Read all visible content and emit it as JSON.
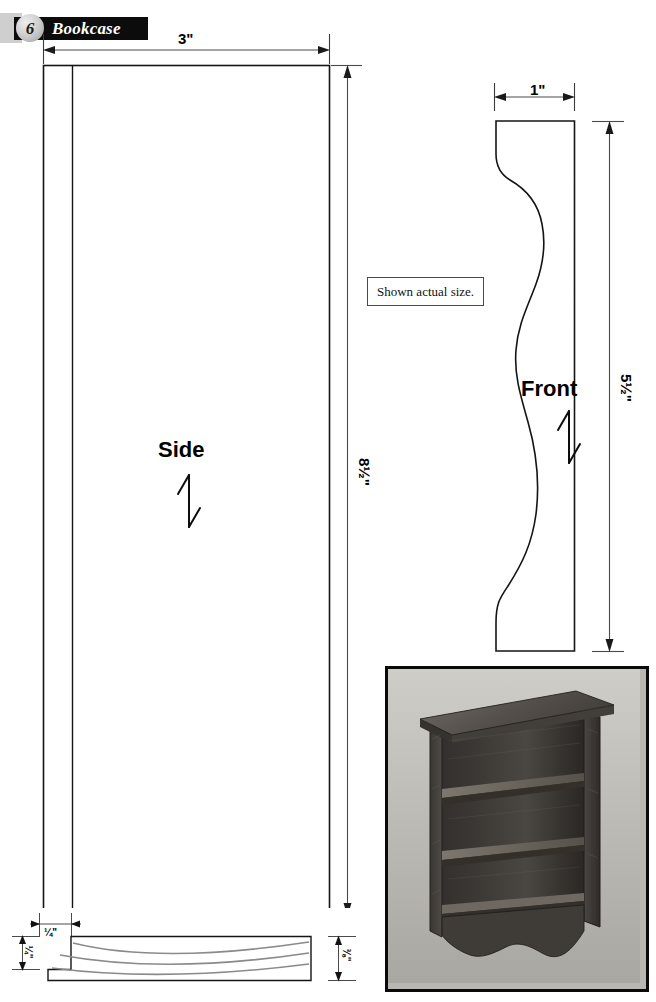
{
  "page": {
    "width": 656,
    "height": 1002,
    "background": "#ffffff",
    "ink": "#000000"
  },
  "header": {
    "number": "6",
    "title": "Bookcase",
    "bar_color": "#0c0c0c",
    "tab_color": "#cfcfcf",
    "title_color": "#ffffff"
  },
  "note": {
    "text": "Shown actual size."
  },
  "parts": [
    {
      "id": "side",
      "label": "Side",
      "grain_arrow": "grain-direction-arrow",
      "dimensions": [
        {
          "id": "side-width",
          "value": "3\"",
          "orientation": "horizontal"
        },
        {
          "id": "side-height",
          "value": "8½\"",
          "orientation": "vertical"
        }
      ]
    },
    {
      "id": "front",
      "label": "Front",
      "grain_arrow": "grain-direction-arrow",
      "dimensions": [
        {
          "id": "front-width",
          "value": "1\"",
          "orientation": "horizontal"
        },
        {
          "id": "front-height",
          "value": "5½\"",
          "orientation": "vertical"
        }
      ]
    },
    {
      "id": "cross-section",
      "label": "",
      "dimensions": [
        {
          "id": "rabbet-width",
          "value": "¼\"",
          "orientation": "horizontal"
        },
        {
          "id": "rabbet-depth",
          "value": "¼\"",
          "orientation": "vertical"
        },
        {
          "id": "stock-thickness",
          "value": "⅜\"",
          "orientation": "vertical"
        }
      ]
    }
  ],
  "photo": {
    "caption": "",
    "alt": "finished miniature bookcase with three shelves and scalloped base",
    "border_color": "#0a0a0a",
    "background_color": "#b9b7b2"
  },
  "dimension_values": {
    "side_width": "3\"",
    "side_height": "8½\"",
    "front_width": "1\"",
    "front_height": "5½\"",
    "rabbet_width": "¼\"",
    "rabbet_depth": "¼\"",
    "stock_thickness": "⅜\""
  }
}
